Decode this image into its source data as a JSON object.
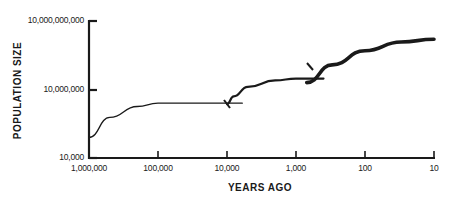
{
  "chart_data": {
    "type": "line",
    "title": "",
    "xlabel": "YEARS AGO",
    "ylabel": "POPULATION SIZE",
    "x_scale": "log (reversed)",
    "y_scale": "log",
    "x_tick_labels": [
      "1,000,000",
      "100,000",
      "10,000",
      "1,000",
      "100",
      "10"
    ],
    "y_tick_labels": [
      "10,000,000,000",
      "10,000,000",
      "10,000"
    ],
    "xlim": [
      1000000,
      10
    ],
    "ylim": [
      10000,
      10000000000
    ],
    "grid": false,
    "legend": "none",
    "series": [
      {
        "name": "curve-1 (thin)",
        "points": [
          {
            "years_ago": 1000000,
            "population": 80000
          },
          {
            "years_ago": 500000,
            "population": 600000
          },
          {
            "years_ago": 200000,
            "population": 1800000
          },
          {
            "years_ago": 100000,
            "population": 2500000
          },
          {
            "years_ago": 10000,
            "population": 2500000
          },
          {
            "years_ago": 6000,
            "population": 2500000
          }
        ]
      },
      {
        "name": "curve-2 (medium)",
        "points": [
          {
            "years_ago": 10000,
            "population": 2300000
          },
          {
            "years_ago": 8000,
            "population": 5000000
          },
          {
            "years_ago": 5000,
            "population": 13000000
          },
          {
            "years_ago": 2000,
            "population": 25000000
          },
          {
            "years_ago": 1000,
            "population": 30000000
          },
          {
            "years_ago": 400,
            "population": 30000000
          }
        ]
      },
      {
        "name": "curve-3 (thick)",
        "points": [
          {
            "years_ago": 700,
            "population": 20000000
          },
          {
            "years_ago": 300,
            "population": 120000000
          },
          {
            "years_ago": 100,
            "population": 500000000
          },
          {
            "years_ago": 30,
            "population": 1200000000
          },
          {
            "years_ago": 10,
            "population": 1600000000
          }
        ]
      }
    ]
  },
  "axes": {
    "y_title": "POPULATION SIZE",
    "x_title": "YEARS AGO",
    "y_ticks": [
      {
        "label": "10,000,000,000",
        "y": 21
      },
      {
        "label": "10,000,000",
        "y": 90
      },
      {
        "label": "10,000",
        "y": 158
      }
    ],
    "x_ticks": [
      {
        "label": "1,000,000",
        "x": 89
      },
      {
        "label": "100,000",
        "x": 158
      },
      {
        "label": "10,000",
        "x": 227
      },
      {
        "label": "1,000",
        "x": 296
      },
      {
        "label": "100",
        "x": 365
      },
      {
        "label": "10",
        "x": 434
      }
    ]
  },
  "colors": {
    "ink": "#1a1a1a",
    "background": "#ffffff"
  }
}
